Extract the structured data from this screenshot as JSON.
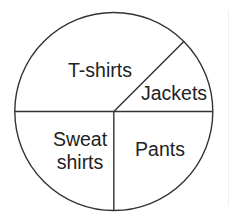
{
  "chart_data": {
    "type": "pie",
    "title": "",
    "categories": [
      "T-shirts",
      "Jackets",
      "Pants",
      "Sweat shirts"
    ],
    "values": [
      37.5,
      12.5,
      25,
      25
    ],
    "unit": "percent (estimated from slice angles)",
    "angles_deg": [
      135,
      45,
      90,
      90
    ],
    "legend": "none (labels inside slices)",
    "labels": [
      {
        "text": "T-shirts",
        "lines": [
          "T-shirts"
        ]
      },
      {
        "text": "Jackets",
        "lines": [
          "Jackets"
        ]
      },
      {
        "text": "Pants",
        "lines": [
          "Pants"
        ]
      },
      {
        "text": "Sweat shirts",
        "lines": [
          "Sweat",
          "shirts"
        ]
      }
    ]
  },
  "style": {
    "stroke_color": "#333333",
    "fill_color": "#ffffff",
    "text_color": "#222222"
  }
}
